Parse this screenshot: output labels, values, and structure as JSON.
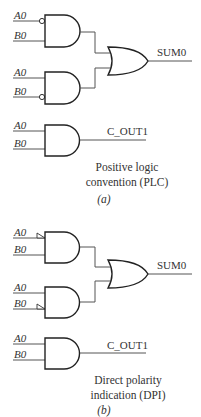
{
  "panel_a": {
    "gate1": {
      "in1": "A0",
      "in2": "B0",
      "bubble": "A0"
    },
    "gate2": {
      "in1": "A0",
      "in2": "B0",
      "bubble": "B0"
    },
    "or_output": "SUM0",
    "gate3": {
      "in1": "A0",
      "in2": "B0",
      "output": "C_OUT1"
    },
    "caption_line1": "Positive logic",
    "caption_line2": "convention (PLC)",
    "label": "(a)"
  },
  "panel_b": {
    "gate1": {
      "in1": "A0",
      "in2": "B0",
      "polarity_indicator": "A0"
    },
    "gate2": {
      "in1": "A0",
      "in2": "B0",
      "polarity_indicator": "B0"
    },
    "or_output": "SUM0",
    "gate3": {
      "in1": "A0",
      "in2": "B0",
      "output": "C_OUT1"
    },
    "caption_line1": "Direct polarity",
    "caption_line2": "indication (DPI)",
    "label": "(b)"
  }
}
